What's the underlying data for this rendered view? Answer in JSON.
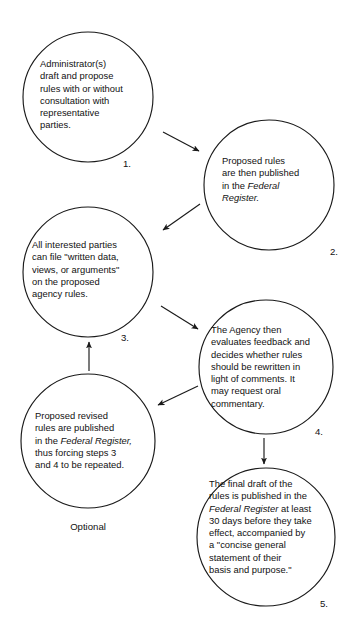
{
  "diagram": {
    "stroke_color": "#1a1a1a",
    "background_color": "#ffffff",
    "optional_label": "Optional",
    "nodes": [
      {
        "id": "node-1",
        "number": "1.",
        "lines": [
          "Administrator(s)",
          "draft and propose",
          "rules with or without",
          "consultation with",
          "representative",
          "parties."
        ],
        "italic_phrases": []
      },
      {
        "id": "node-2",
        "number": "2.",
        "lines": [
          "Proposed rules",
          "are then published",
          "in the Federal",
          "Register."
        ],
        "italic_phrases": [
          "Federal",
          "Register."
        ]
      },
      {
        "id": "node-3",
        "number": "3.",
        "lines": [
          "All interested parties",
          "can file \"written data,",
          "views, or arguments\"",
          "on the proposed",
          "agency rules."
        ],
        "italic_phrases": []
      },
      {
        "id": "node-4",
        "number": "4.",
        "lines": [
          "The Agency then",
          "evaluates feedback and",
          "decides whether rules",
          "should be rewritten in",
          "light of comments. It",
          "may request oral",
          "commentary."
        ],
        "italic_phrases": []
      },
      {
        "id": "node-optional",
        "number": "",
        "lines": [
          "Proposed revised",
          "rules are published",
          "in the Federal Register,",
          "thus forcing steps 3",
          "and 4 to be repeated."
        ],
        "italic_phrases": [
          "Federal Register,"
        ]
      },
      {
        "id": "node-5",
        "number": "5.",
        "lines": [
          "The final draft of the",
          "rules is published in the",
          "Federal Register at least",
          "30 days before they take",
          "effect, accompanied by",
          "a \"concise general",
          "statement of their",
          "basis and purpose.\""
        ],
        "italic_phrases": [
          "Federal Register"
        ]
      }
    ],
    "edges": [
      {
        "id": "edge-1-2",
        "from": "node-1",
        "to": "node-2",
        "direction": "down-right"
      },
      {
        "id": "edge-2-3",
        "from": "node-2",
        "to": "node-3",
        "direction": "down-left"
      },
      {
        "id": "edge-3-4",
        "from": "node-3",
        "to": "node-4",
        "direction": "down-right"
      },
      {
        "id": "edge-4-optional",
        "from": "node-4",
        "to": "node-optional",
        "direction": "down-left"
      },
      {
        "id": "edge-optional-3",
        "from": "node-optional",
        "to": "node-3",
        "direction": "up"
      },
      {
        "id": "edge-4-5",
        "from": "node-4",
        "to": "node-5",
        "direction": "down"
      }
    ]
  }
}
